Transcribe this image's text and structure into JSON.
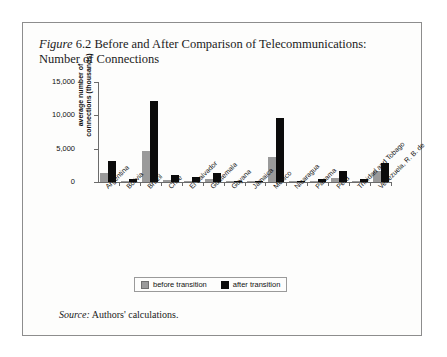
{
  "figure": {
    "label": "Figure",
    "number": "6.2",
    "title": "Before and After Comparison of Telecommunications: Number of Connections",
    "title_line1": "Before and After Comparison of",
    "title_line2": "Telecommunications: Number of Connections"
  },
  "source": {
    "label": "Source:",
    "text": "Authors' calculations."
  },
  "legend": {
    "before_label": "before transition",
    "after_label": "after transition"
  },
  "colors": {
    "before": "#9a9a9a",
    "after": "#0b0b0b",
    "axis": "#6b6b6b",
    "card_background": "#fdfdfc",
    "card_border": "#8d8d8d"
  },
  "chart_data": {
    "type": "bar",
    "title": "Figure 6.2 Before and After Comparison of Telecommunications: Number of Connections",
    "xlabel": "",
    "ylabel": "average number of connections (thousands)",
    "ylim": [
      0,
      15000
    ],
    "yticks": [
      0,
      5000,
      10000,
      15000
    ],
    "ytick_labels": [
      "0",
      "5,000",
      "10,000",
      "15,000"
    ],
    "grid": false,
    "legend_position": "bottom-center",
    "categories": [
      "Argentina",
      "Bolivia",
      "Brazil",
      "Chile",
      "El Salvador",
      "Guatemala",
      "Guyana",
      "Jamaica",
      "Mexico",
      "Nicaragua",
      "Panama",
      "Peru",
      "Trinidad and Tobago",
      "Venezuela, R. B. de"
    ],
    "series": [
      {
        "name": "before transition",
        "color": "#9a9a9a",
        "values": [
          1400,
          200,
          4700,
          300,
          120,
          400,
          30,
          60,
          3800,
          60,
          180,
          600,
          200,
          1700
        ]
      },
      {
        "name": "after transition",
        "color": "#0b0b0b",
        "values": [
          3200,
          500,
          12100,
          1100,
          700,
          1400,
          50,
          200,
          9600,
          150,
          400,
          1700,
          450,
          2800
        ]
      }
    ]
  }
}
